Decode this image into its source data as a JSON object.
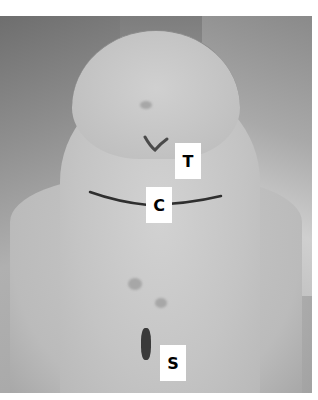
{
  "image": {
    "description": "Clinical photograph of anterior neck with surgical skin markings, surrounded by drapes",
    "labels": [
      {
        "id": "T",
        "text": "T",
        "marker": "V-shaped mark"
      },
      {
        "id": "C",
        "text": "C",
        "marker": "curved horizontal incision line"
      },
      {
        "id": "S",
        "text": "S",
        "marker": "vertical short mark"
      }
    ]
  }
}
